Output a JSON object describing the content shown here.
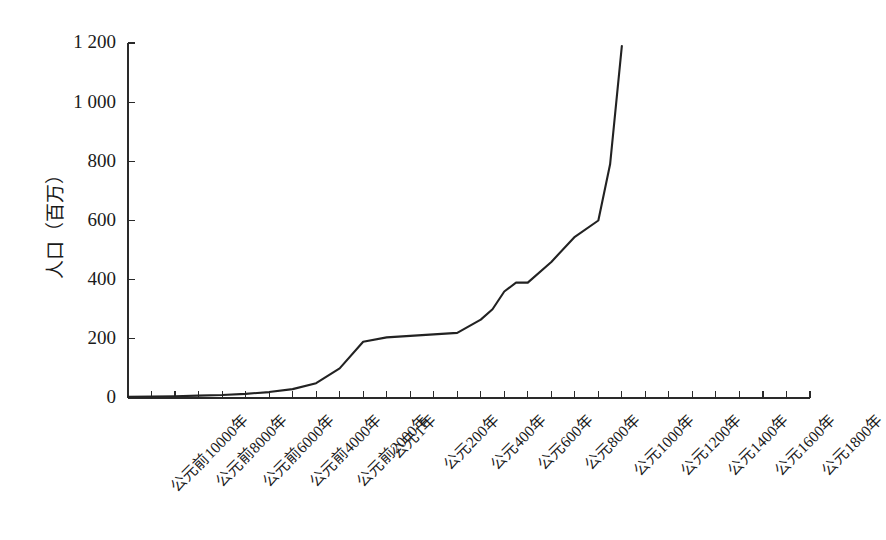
{
  "chart_data": {
    "type": "line",
    "title": "",
    "subtitle": "",
    "xlabel": "",
    "ylabel": "人口（百万）",
    "ylim": [
      0,
      1200
    ],
    "yticks": [
      0,
      200,
      400,
      600,
      800,
      1000,
      1200
    ],
    "ytick_labels": [
      "0",
      "200",
      "400",
      "600",
      "800",
      "1 000",
      "1 200"
    ],
    "grid": false,
    "legend": null,
    "legend_position": "none",
    "line_color": "#222222",
    "axis_color": "#2a2a2a",
    "x_tick_labels": [
      "公元前10000年",
      "公元前8000年",
      "公元前6000年",
      "公元前4000年",
      "公元前2000年",
      "公元1年",
      "公元200年",
      "公元400年",
      "公元600年",
      "公元800年",
      "公元1000年",
      "公元1200年",
      "公元1400年",
      "公元1600年",
      "公元1800年"
    ],
    "x_labeled_indices": [
      0,
      2,
      4,
      6,
      8,
      10,
      12,
      14,
      16,
      18,
      20,
      22,
      24,
      26,
      28
    ],
    "x_minor_count": 29,
    "x": [
      -10000,
      -9000,
      -8000,
      -7000,
      -6000,
      -5000,
      -4000,
      -3000,
      -2000,
      -1000,
      1,
      200,
      400,
      600,
      800,
      1000,
      1100,
      1200,
      1300,
      1400,
      1500,
      1600,
      1700,
      1750,
      1800
    ],
    "x_pos_index": [
      0,
      1,
      2,
      3,
      4,
      5,
      6,
      7,
      8,
      9,
      10,
      11,
      12,
      13,
      14,
      15,
      15.5,
      16,
      16.5,
      17,
      18,
      19,
      20,
      20.5,
      21
    ],
    "values": [
      4,
      5,
      6,
      8,
      10,
      14,
      20,
      30,
      50,
      100,
      190,
      205,
      210,
      215,
      220,
      265,
      300,
      360,
      390,
      390,
      460,
      545,
      600,
      790,
      1190
    ],
    "annotations": []
  }
}
